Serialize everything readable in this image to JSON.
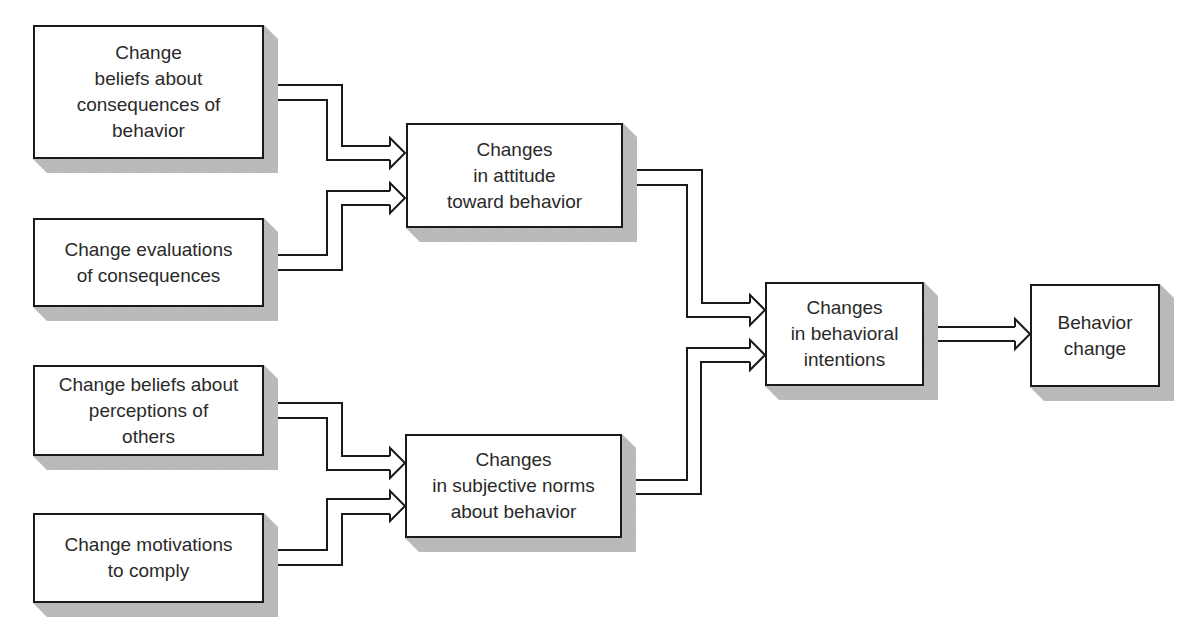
{
  "diagram": {
    "type": "flowchart",
    "colors": {
      "box_border": "#1a1a1a",
      "box_fill": "#ffffff",
      "shadow": "#b4b4b4",
      "text": "#2a2a2a",
      "arrow_stroke": "#1a1a1a"
    },
    "nodes": [
      {
        "id": "beliefs-consequences",
        "label": "Change\nbeliefs about\nconsequences of\nbehavior",
        "x": 33,
        "y": 25,
        "w": 231,
        "h": 134
      },
      {
        "id": "evaluations-consequences",
        "label": "Change evaluations\nof consequences",
        "x": 33,
        "y": 218,
        "w": 231,
        "h": 89
      },
      {
        "id": "attitude-change",
        "label": "Changes\nin attitude\ntoward behavior",
        "x": 406,
        "y": 123,
        "w": 217,
        "h": 105
      },
      {
        "id": "beliefs-perceptions",
        "label": "Change beliefs about\nperceptions of\nothers",
        "x": 33,
        "y": 365,
        "w": 231,
        "h": 91
      },
      {
        "id": "motivations-comply",
        "label": "Change motivations\nto comply",
        "x": 33,
        "y": 513,
        "w": 231,
        "h": 90
      },
      {
        "id": "subjective-norms-change",
        "label": "Changes\nin subjective norms\nabout behavior",
        "x": 405,
        "y": 434,
        "w": 217,
        "h": 104
      },
      {
        "id": "behavioral-intentions-change",
        "label": "Changes\nin behavioral\nintentions",
        "x": 765,
        "y": 282,
        "w": 159,
        "h": 104
      },
      {
        "id": "behavior-change",
        "label": "Behavior\nchange",
        "x": 1030,
        "y": 284,
        "w": 130,
        "h": 103
      }
    ],
    "edges": [
      {
        "from": "beliefs-consequences",
        "to": "attitude-change"
      },
      {
        "from": "evaluations-consequences",
        "to": "attitude-change"
      },
      {
        "from": "beliefs-perceptions",
        "to": "subjective-norms-change"
      },
      {
        "from": "motivations-comply",
        "to": "subjective-norms-change"
      },
      {
        "from": "attitude-change",
        "to": "behavioral-intentions-change"
      },
      {
        "from": "subjective-norms-change",
        "to": "behavioral-intentions-change"
      },
      {
        "from": "behavioral-intentions-change",
        "to": "behavior-change"
      }
    ]
  }
}
